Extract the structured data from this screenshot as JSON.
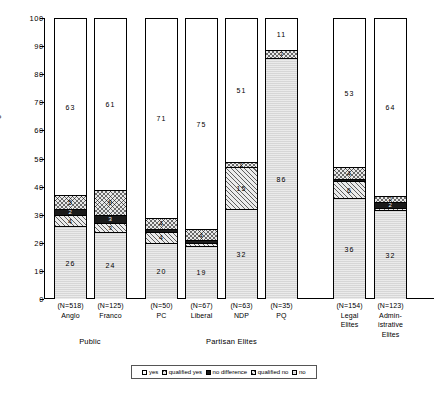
{
  "chart_data": {
    "type": "bar",
    "subtype": "stacked-percentage-column",
    "title": "",
    "xlabel": "",
    "ylabel": "Percentage",
    "ylim": [
      0,
      100
    ],
    "yticks": [
      0,
      10,
      20,
      30,
      40,
      50,
      60,
      70,
      80,
      90,
      100
    ],
    "grid": false,
    "legend_position": "bottom",
    "legend": [
      "yes",
      "qualified yes",
      "no difference",
      "qualified no",
      "no"
    ],
    "categories": [
      {
        "n": "(N=518)",
        "name": "Anglo",
        "group": "Public"
      },
      {
        "n": "(N=125)",
        "name": "Franco",
        "group": "Public"
      },
      {
        "n": "(N=50)",
        "name": "PC",
        "group": "Partisan Elites"
      },
      {
        "n": "(N=67)",
        "name": "Liberal",
        "group": "Partisan Elites"
      },
      {
        "n": "(N=63)",
        "name": "NDP",
        "group": "Partisan Elites"
      },
      {
        "n": "(N=35)",
        "name": "PQ",
        "group": "Partisan Elites"
      },
      {
        "n": "(N=154)",
        "name": "Legal Elites",
        "group": ""
      },
      {
        "n": "(N=123)",
        "name": "Administrative Elites",
        "group": ""
      }
    ],
    "groups": [
      {
        "label": "Public",
        "from": 0,
        "to": 1
      },
      {
        "label": "Partisan Elites",
        "from": 2,
        "to": 5
      }
    ],
    "series": [
      {
        "name": "yes",
        "fill": "open",
        "values": [
          63,
          61,
          71,
          75,
          51,
          11,
          53,
          64
        ]
      },
      {
        "name": "qualified yes",
        "fill": "cross-hatch",
        "values": [
          5,
          9,
          4,
          4,
          2,
          3,
          4,
          2
        ]
      },
      {
        "name": "no difference",
        "fill": "solid-black",
        "values": [
          2,
          3,
          1,
          1,
          2,
          0,
          1,
          2
        ]
      },
      {
        "name": "qualified no",
        "fill": "diagonal-hatch",
        "values": [
          4,
          3,
          4,
          1,
          15,
          0,
          6,
          1
        ]
      },
      {
        "name": "no",
        "fill": "light-stipple",
        "values": [
          26,
          24,
          20,
          19,
          32,
          86,
          36,
          32
        ]
      }
    ],
    "labels_shown": [
      {
        "category": "Anglo",
        "labels": {
          "yes": "63",
          "qualified yes": "5",
          "no difference": "2",
          "qualified no": "4",
          "no": "26"
        }
      },
      {
        "category": "Franco",
        "labels": {
          "yes": "61",
          "qualified yes": "9",
          "no difference": "3",
          "qualified no": "3",
          "no": "24"
        }
      },
      {
        "category": "PC",
        "labels": {
          "yes": "71",
          "qualified yes": "4",
          "no difference": "",
          "qualified no": "4",
          "no": "20"
        }
      },
      {
        "category": "Liberal",
        "labels": {
          "yes": "75",
          "qualified yes": "4",
          "no difference": "",
          "qualified no": "",
          "no": "19"
        }
      },
      {
        "category": "NDP",
        "labels": {
          "yes": "51",
          "qualified yes": "2",
          "no difference": "",
          "qualified no": "15",
          "no": "32"
        }
      },
      {
        "category": "PQ",
        "labels": {
          "yes": "11",
          "qualified yes": "3",
          "no difference": "",
          "qualified no": "",
          "no": "86"
        }
      },
      {
        "category": "Legal Elites",
        "labels": {
          "yes": "53",
          "qualified yes": "4",
          "no difference": "",
          "qualified no": "6",
          "no": "36"
        }
      },
      {
        "category": "Administrative Elites",
        "labels": {
          "yes": "64",
          "qualified yes": "2",
          "no difference": "2",
          "qualified no": "",
          "no": "32"
        }
      }
    ]
  },
  "axis": {
    "y_label": "Percentage",
    "ticks": [
      "100",
      "90",
      "80",
      "70",
      "60",
      "50",
      "40",
      "30",
      "20",
      "10",
      "0"
    ]
  },
  "bars": [
    {
      "n": "(N=518)",
      "name_line1": "Anglo",
      "name_line2": "",
      "name_line3": "",
      "segments": [
        {
          "key": "yes",
          "value": 63,
          "label": "63"
        },
        {
          "key": "qualified yes",
          "value": 5,
          "label": "5"
        },
        {
          "key": "no difference",
          "value": 2,
          "label": "2"
        },
        {
          "key": "qualified no",
          "value": 4,
          "label": "4"
        },
        {
          "key": "no",
          "value": 26,
          "label": "26"
        }
      ]
    },
    {
      "n": "(N=125)",
      "name_line1": "Franco",
      "name_line2": "",
      "name_line3": "",
      "segments": [
        {
          "key": "yes",
          "value": 61,
          "label": "61"
        },
        {
          "key": "qualified yes",
          "value": 9,
          "label": "9"
        },
        {
          "key": "no difference",
          "value": 3,
          "label": "3"
        },
        {
          "key": "qualified no",
          "value": 3,
          "label": "3"
        },
        {
          "key": "no",
          "value": 24,
          "label": "24"
        }
      ]
    },
    {
      "n": "(N=50)",
      "name_line1": "PC",
      "name_line2": "",
      "name_line3": "",
      "segments": [
        {
          "key": "yes",
          "value": 71,
          "label": "71"
        },
        {
          "key": "qualified yes",
          "value": 4,
          "label": "4"
        },
        {
          "key": "no difference",
          "value": 1,
          "label": ""
        },
        {
          "key": "qualified no",
          "value": 4,
          "label": "4"
        },
        {
          "key": "no",
          "value": 20,
          "label": "20"
        }
      ]
    },
    {
      "n": "(N=67)",
      "name_line1": "Liberal",
      "name_line2": "",
      "name_line3": "",
      "segments": [
        {
          "key": "yes",
          "value": 75,
          "label": "75"
        },
        {
          "key": "qualified yes",
          "value": 4,
          "label": "4"
        },
        {
          "key": "no difference",
          "value": 1,
          "label": ""
        },
        {
          "key": "qualified no",
          "value": 1,
          "label": ""
        },
        {
          "key": "no",
          "value": 19,
          "label": "19"
        }
      ]
    },
    {
      "n": "(N=63)",
      "name_line1": "NDP",
      "name_line2": "",
      "name_line3": "",
      "segments": [
        {
          "key": "yes",
          "value": 51,
          "label": "51"
        },
        {
          "key": "qualified yes",
          "value": 2,
          "label": "2"
        },
        {
          "key": "no difference",
          "value": 0,
          "label": ""
        },
        {
          "key": "qualified no",
          "value": 15,
          "label": "15"
        },
        {
          "key": "no",
          "value": 32,
          "label": "32"
        }
      ]
    },
    {
      "n": "(N=35)",
      "name_line1": "PQ",
      "name_line2": "",
      "name_line3": "",
      "segments": [
        {
          "key": "yes",
          "value": 11,
          "label": "11"
        },
        {
          "key": "qualified yes",
          "value": 3,
          "label": "3"
        },
        {
          "key": "no difference",
          "value": 0,
          "label": ""
        },
        {
          "key": "qualified no",
          "value": 0,
          "label": ""
        },
        {
          "key": "no",
          "value": 86,
          "label": "86"
        }
      ]
    },
    {
      "n": "(N=154)",
      "name_line1": "Legal",
      "name_line2": "Elites",
      "name_line3": "",
      "segments": [
        {
          "key": "yes",
          "value": 53,
          "label": "53"
        },
        {
          "key": "qualified yes",
          "value": 4,
          "label": "4"
        },
        {
          "key": "no difference",
          "value": 1,
          "label": ""
        },
        {
          "key": "qualified no",
          "value": 6,
          "label": "6"
        },
        {
          "key": "no",
          "value": 36,
          "label": "36"
        }
      ]
    },
    {
      "n": "(N=123)",
      "name_line1": "Admin-",
      "name_line2": "istrative",
      "name_line3": "Elites",
      "segments": [
        {
          "key": "yes",
          "value": 64,
          "label": "64"
        },
        {
          "key": "qualified yes",
          "value": 2,
          "label": "2"
        },
        {
          "key": "no difference",
          "value": 2,
          "label": "2"
        },
        {
          "key": "qualified no",
          "value": 1,
          "label": ""
        },
        {
          "key": "no",
          "value": 32,
          "label": "32"
        }
      ]
    }
  ],
  "groups": [
    {
      "label": "Public"
    },
    {
      "label": "Partisan Elites"
    }
  ],
  "legend": {
    "items": [
      {
        "label": "yes",
        "fill": "open"
      },
      {
        "label": "qualified yes",
        "fill": "cross-hatch"
      },
      {
        "label": "no difference",
        "fill": "solid-black"
      },
      {
        "label": "qualified no",
        "fill": "diagonal-hatch"
      },
      {
        "label": "no",
        "fill": "light-stipple"
      }
    ]
  },
  "colors": {
    "axis": "#000000",
    "no_difference": "#1a1a1a",
    "no": "#d6d6d6",
    "qualified": "#e9e9e9",
    "background": "#ffffff"
  }
}
